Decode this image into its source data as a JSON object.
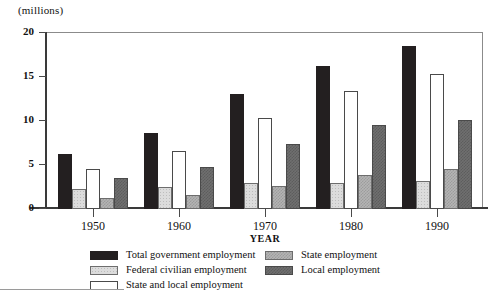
{
  "chart_data": {
    "type": "bar",
    "title": "",
    "unit_label": "(millions)",
    "xlabel": "YEAR",
    "ylabel": "",
    "categories": [
      "1950",
      "1960",
      "1970",
      "1980",
      "1990"
    ],
    "ylim": [
      0,
      20
    ],
    "yticks": [
      0,
      5,
      10,
      15,
      20
    ],
    "ytick_labels": [
      "0",
      "5",
      "10",
      "15",
      "20"
    ],
    "grid": false,
    "legend_position": "below-plot",
    "series": [
      {
        "name": "Total government employment",
        "swatch": "solid-black",
        "color": "#231f20",
        "values": [
          6.2,
          8.6,
          13.1,
          16.3,
          18.5
        ]
      },
      {
        "name": "Federal civilian employment",
        "swatch": "light-gray-dotted",
        "color": "#dcdcdc",
        "values": [
          2.3,
          2.5,
          2.9,
          2.9,
          3.2
        ]
      },
      {
        "name": "State and local employment",
        "swatch": "white-outline",
        "color": "#ffffff",
        "values": [
          4.5,
          6.6,
          10.3,
          13.4,
          15.3
        ]
      },
      {
        "name": "State employment",
        "swatch": "medium-gray-checker",
        "color": "#b4b4b4",
        "values": [
          1.3,
          1.6,
          2.6,
          3.9,
          4.5
        ]
      },
      {
        "name": "Local employment",
        "swatch": "dark-gray-checker",
        "color": "#6f6f6f",
        "values": [
          3.5,
          4.8,
          7.4,
          9.5,
          10.1
        ]
      }
    ]
  },
  "legend": {
    "left_column": [
      "Total government employment",
      "Federal civilian employment",
      "State and local employment"
    ],
    "right_column": [
      "State employment",
      "Local employment"
    ]
  }
}
